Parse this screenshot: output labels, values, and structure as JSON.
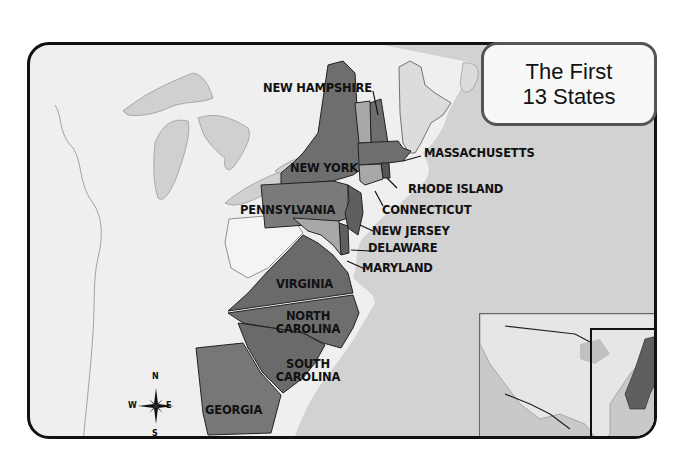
{
  "title": {
    "line1": "The First",
    "line2": "13 States"
  },
  "states": [
    {
      "name": "NEW HAMPSHIRE"
    },
    {
      "name": "MASSACHUSETTS"
    },
    {
      "name": "NEW YORK"
    },
    {
      "name": "RHODE ISLAND"
    },
    {
      "name": "CONNECTICUT"
    },
    {
      "name": "PENNSYLVANIA"
    },
    {
      "name": "NEW JERSEY"
    },
    {
      "name": "DELAWARE"
    },
    {
      "name": "MARYLAND"
    },
    {
      "name": "VIRGINIA"
    },
    {
      "name": "NORTH",
      "name2": "CAROLINA"
    },
    {
      "name": "SOUTH",
      "name2": "CAROLINA"
    },
    {
      "name": "GEORGIA"
    }
  ],
  "compass": {
    "n": "N",
    "s": "S",
    "e": "E",
    "w": "W"
  },
  "colors": {
    "frame_bg": "#efefef",
    "state_fill": "#6e6e6e",
    "state_fill_light": "#9a9a9a",
    "water": "#c9c9c9",
    "non_colony_land": "#e4e4e4"
  },
  "inset": {
    "description": "locator map of North America with highlighted box around east coast"
  }
}
